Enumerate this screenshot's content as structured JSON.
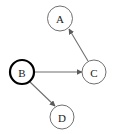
{
  "diagram": {
    "type": "directed-graph",
    "title": "",
    "width": 114,
    "height": 134,
    "background_color": "#ffffff",
    "default_node_color": "#ffffff",
    "default_node_stroke": "#707070",
    "highlight_node_stroke": "#000000",
    "edge_color": "#6e6e6e",
    "label_color": "#1a1a1a",
    "nodes": [
      {
        "id": "A",
        "label": "A",
        "cx": 60,
        "cy": 18.5,
        "r": 12.5,
        "highlighted": false,
        "stroke_width": 1
      },
      {
        "id": "B",
        "label": "B",
        "cx": 22,
        "cy": 72,
        "r": 12,
        "highlighted": true,
        "stroke_width": 2.2
      },
      {
        "id": "C",
        "label": "C",
        "cx": 94,
        "cy": 72,
        "r": 12,
        "highlighted": false,
        "stroke_width": 1
      },
      {
        "id": "D",
        "label": "D",
        "cx": 62,
        "cy": 117,
        "r": 12,
        "highlighted": false,
        "stroke_width": 1
      }
    ],
    "edges": [
      {
        "id": "edge-b-c",
        "from": "B",
        "to": "C",
        "directed": true,
        "x1": 34,
        "y1": 72,
        "x2": 82,
        "y2": 72
      },
      {
        "id": "edge-b-d",
        "from": "B",
        "to": "D",
        "directed": true,
        "x1": 30,
        "y1": 82,
        "x2": 55,
        "y2": 106
      },
      {
        "id": "edge-c-a",
        "from": "C",
        "to": "A",
        "directed": true,
        "x1": 88,
        "y1": 61,
        "x2": 69,
        "y2": 29
      }
    ]
  }
}
